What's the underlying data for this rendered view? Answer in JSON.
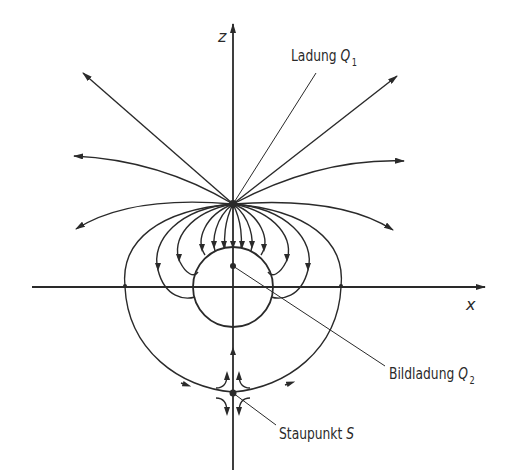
{
  "figure": {
    "axes": {
      "z_label": "z",
      "x_label": "x"
    },
    "labels": {
      "charge_q1": {
        "text": "Ladung",
        "symbol": "Q",
        "subscript": "1"
      },
      "image_charge_q2": {
        "text": "Bildladung",
        "symbol": "Q",
        "subscript": "2"
      },
      "stagnation_point": {
        "text": "Staupunkt",
        "symbol": "S"
      }
    },
    "colors": {
      "ink": "#2a2a2a",
      "background": "#ffffff"
    }
  }
}
